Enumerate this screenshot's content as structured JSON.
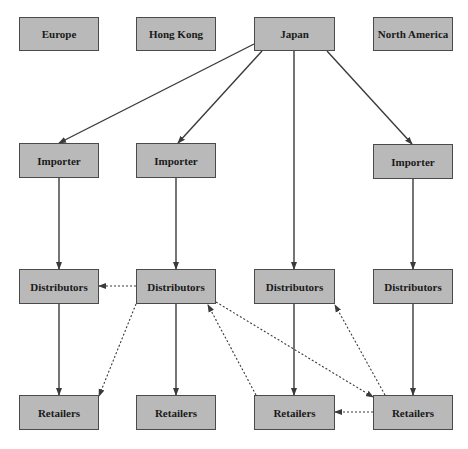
{
  "diagram": {
    "type": "flow",
    "colors": {
      "box_fill": "#b9b9b9",
      "box_border": "#4a4a4a",
      "edge": "#3a3a3a"
    },
    "nodes": [
      {
        "id": "europe",
        "label": "Europe",
        "x": 19,
        "y": 17,
        "w": 80,
        "h": 34
      },
      {
        "id": "hongkong",
        "label": "Hong Kong",
        "x": 136,
        "y": 17,
        "w": 80,
        "h": 34
      },
      {
        "id": "japan",
        "label": "Japan",
        "x": 254,
        "y": 17,
        "w": 81,
        "h": 34
      },
      {
        "id": "northamerica",
        "label": "North America",
        "x": 373,
        "y": 17,
        "w": 80,
        "h": 34
      },
      {
        "id": "imp1",
        "label": "Importer",
        "x": 19,
        "y": 143,
        "w": 80,
        "h": 35
      },
      {
        "id": "imp2",
        "label": "Importer",
        "x": 136,
        "y": 143,
        "w": 80,
        "h": 35
      },
      {
        "id": "imp4",
        "label": "Importer",
        "x": 373,
        "y": 144,
        "w": 80,
        "h": 35
      },
      {
        "id": "dist1",
        "label": "Distributors",
        "x": 19,
        "y": 269,
        "w": 80,
        "h": 35
      },
      {
        "id": "dist2",
        "label": "Distributors",
        "x": 136,
        "y": 269,
        "w": 80,
        "h": 35
      },
      {
        "id": "dist3",
        "label": "Distributors",
        "x": 254,
        "y": 269,
        "w": 81,
        "h": 35
      },
      {
        "id": "dist4",
        "label": "Distributors",
        "x": 373,
        "y": 269,
        "w": 80,
        "h": 35
      },
      {
        "id": "ret1",
        "label": "Retailers",
        "x": 19,
        "y": 395,
        "w": 80,
        "h": 35
      },
      {
        "id": "ret2",
        "label": "Retailers",
        "x": 136,
        "y": 395,
        "w": 80,
        "h": 35
      },
      {
        "id": "ret3",
        "label": "Retailers",
        "x": 254,
        "y": 395,
        "w": 81,
        "h": 35
      },
      {
        "id": "ret4",
        "label": "Retailers",
        "x": 373,
        "y": 395,
        "w": 80,
        "h": 35
      }
    ],
    "edges": [
      {
        "from": "japan",
        "to": "imp1",
        "style": "solid",
        "x1": 254,
        "y1": 44,
        "x2": 59,
        "y2": 143
      },
      {
        "from": "japan",
        "to": "imp2",
        "style": "solid",
        "x1": 262,
        "y1": 51,
        "x2": 178,
        "y2": 143
      },
      {
        "from": "japan",
        "to": "dist3",
        "style": "solid",
        "x1": 294,
        "y1": 51,
        "x2": 294,
        "y2": 269
      },
      {
        "from": "japan",
        "to": "imp4",
        "style": "solid",
        "x1": 327,
        "y1": 51,
        "x2": 412,
        "y2": 144
      },
      {
        "from": "imp1",
        "to": "dist1",
        "style": "solid",
        "x1": 59,
        "y1": 178,
        "x2": 59,
        "y2": 269
      },
      {
        "from": "imp2",
        "to": "dist2",
        "style": "solid",
        "x1": 176,
        "y1": 178,
        "x2": 176,
        "y2": 269
      },
      {
        "from": "imp4",
        "to": "dist4",
        "style": "solid",
        "x1": 413,
        "y1": 179,
        "x2": 413,
        "y2": 269
      },
      {
        "from": "dist1",
        "to": "ret1",
        "style": "solid",
        "x1": 59,
        "y1": 304,
        "x2": 59,
        "y2": 395
      },
      {
        "from": "dist2",
        "to": "ret2",
        "style": "solid",
        "x1": 176,
        "y1": 304,
        "x2": 176,
        "y2": 395
      },
      {
        "from": "dist3",
        "to": "ret3",
        "style": "solid",
        "x1": 294,
        "y1": 304,
        "x2": 294,
        "y2": 395
      },
      {
        "from": "dist4",
        "to": "ret4",
        "style": "solid",
        "x1": 413,
        "y1": 304,
        "x2": 413,
        "y2": 395
      },
      {
        "from": "dist2",
        "to": "dist1",
        "style": "dotted",
        "x1": 136,
        "y1": 286,
        "x2": 99,
        "y2": 286
      },
      {
        "from": "dist2",
        "to": "ret1",
        "style": "dotted",
        "x1": 136,
        "y1": 304,
        "x2": 99,
        "y2": 396
      },
      {
        "from": "ret3",
        "to": "dist2",
        "style": "dotted",
        "x1": 256,
        "y1": 395,
        "x2": 208,
        "y2": 305
      },
      {
        "from": "dist2",
        "to": "ret4",
        "style": "dotted",
        "x1": 216,
        "y1": 302,
        "x2": 373,
        "y2": 397
      },
      {
        "from": "ret4",
        "to": "dist3",
        "style": "dotted",
        "x1": 385,
        "y1": 395,
        "x2": 335,
        "y2": 305
      },
      {
        "from": "ret4",
        "to": "ret3",
        "style": "dotted",
        "x1": 373,
        "y1": 412,
        "x2": 335,
        "y2": 412
      }
    ]
  }
}
